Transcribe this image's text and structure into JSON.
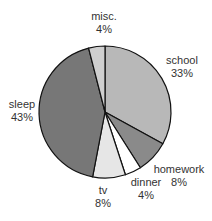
{
  "chart_data": {
    "type": "pie",
    "title": "",
    "start_angle_deg": 0,
    "direction": "clockwise",
    "slices": [
      {
        "label": "school",
        "value": 33,
        "pct_label": "33%",
        "color": "#b8b8b8"
      },
      {
        "label": "homework",
        "value": 8,
        "pct_label": "8%",
        "color": "#8a8a8a"
      },
      {
        "label": "dinner",
        "value": 4,
        "pct_label": "4%",
        "color": "#ffffff"
      },
      {
        "label": "tv",
        "value": 8,
        "pct_label": "8%",
        "color": "#e6e6e6"
      },
      {
        "label": "sleep",
        "value": 43,
        "pct_label": "43%",
        "color": "#777777"
      },
      {
        "label": "misc.",
        "value": 4,
        "pct_label": "4%",
        "color": "#cfcfcf"
      }
    ],
    "legend": "none",
    "labels_outside": true
  },
  "labels": {
    "school": {
      "name": "school",
      "pct": "33%"
    },
    "homework": {
      "name": "homework",
      "pct": "8%"
    },
    "dinner": {
      "name": "dinner",
      "pct": "4%"
    },
    "tv": {
      "name": "tv",
      "pct": "8%"
    },
    "sleep": {
      "name": "sleep",
      "pct": "43%"
    },
    "misc": {
      "name": "misc.",
      "pct": "4%"
    }
  }
}
